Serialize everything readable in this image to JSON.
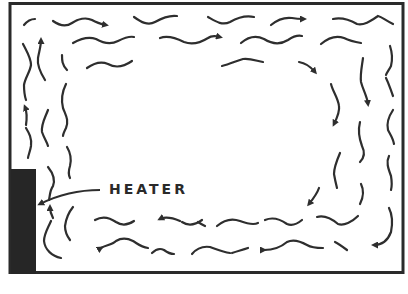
{
  "diagram": {
    "labels": {
      "heater": "HEATER"
    },
    "colors": {
      "ink": "#2e2e2e",
      "heater_fill": "#262626",
      "background": "#ffffff"
    },
    "flow": {
      "left_wall": "up",
      "ceiling": "right",
      "right_wall": "down",
      "floor": "left"
    }
  }
}
